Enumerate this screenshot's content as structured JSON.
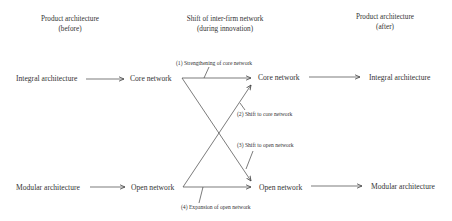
{
  "headers": {
    "before": {
      "line1": "Product architecture",
      "line2": "(before)"
    },
    "middle": {
      "line1": "Shift of inter-firm network",
      "line2": "(during innovation)"
    },
    "after": {
      "line1": "Product architecture",
      "line2": "(after)"
    }
  },
  "nodes": {
    "integral_before": "Integral architecture",
    "core_before": "Core network",
    "core_after": "Core network",
    "integral_after": "Integral architecture",
    "modular_before": "Modular architecture",
    "open_before": "Open network",
    "open_after": "Open network",
    "modular_after": "Modular architecture"
  },
  "transitions": [
    {
      "id": "1",
      "label": "(1) Strengthening of core network"
    },
    {
      "id": "2",
      "label": "(2) Shift to core network"
    },
    {
      "id": "3",
      "label": "(3) Shift to open network"
    },
    {
      "id": "4",
      "label": "(4) Expansion of open network"
    }
  ],
  "colors": {
    "line": "#444444",
    "text": "#333333",
    "background": "#ffffff"
  }
}
